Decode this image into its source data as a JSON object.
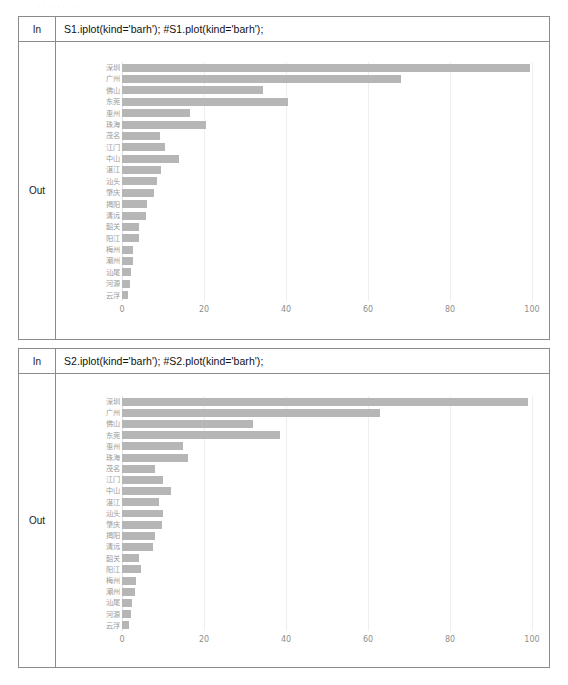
{
  "document": {
    "header_text": "· · · · · · · · · ·"
  },
  "cells": [
    {
      "in_label": "In",
      "out_label": "Out",
      "code": "S1.iplot(kind='barh'); #S1.plot(kind='barh');"
    },
    {
      "in_label": "In",
      "out_label": "Out",
      "code": "S2.iplot(kind='barh'); #S2.plot(kind='barh');"
    }
  ],
  "theme": {
    "bar_color": "#b6b6b6",
    "grid_color": "#ededf2",
    "tick_color": "#8e8e8e",
    "label_color": "#9a9a9a",
    "border_color": "#8a8a8a"
  },
  "chart_data": [
    {
      "type": "bar",
      "orientation": "horizontal",
      "title": "",
      "xlabel": "",
      "ylabel": "",
      "xlim": [
        0,
        100
      ],
      "xticks": [
        0,
        20,
        40,
        60,
        80,
        100
      ],
      "grid": true,
      "legend": false,
      "categories": [
        "云浮",
        "河源",
        "汕尾",
        "潮州",
        "梅州",
        "阳江",
        "韶关",
        "清远",
        "揭阳",
        "肇庆",
        "汕头",
        "湛江",
        "中山",
        "江门",
        "茂名",
        "珠海",
        "惠州",
        "东莞",
        "佛山",
        "广州",
        "深圳"
      ],
      "values": [
        1.5,
        2.0,
        2.2,
        2.8,
        2.8,
        4.2,
        4.2,
        5.8,
        6.2,
        7.8,
        8.6,
        9.5,
        14.0,
        10.5,
        9.2,
        20.5,
        16.5,
        40.5,
        34.5,
        68.0,
        99.5
      ]
    },
    {
      "type": "bar",
      "orientation": "horizontal",
      "title": "",
      "xlabel": "",
      "ylabel": "",
      "xlim": [
        0,
        100
      ],
      "xticks": [
        0,
        20,
        40,
        60,
        80,
        100
      ],
      "grid": true,
      "legend": false,
      "categories": [
        "云浮",
        "河源",
        "汕尾",
        "潮州",
        "梅州",
        "阳江",
        "韶关",
        "清远",
        "揭阳",
        "肇庆",
        "汕头",
        "湛江",
        "中山",
        "江门",
        "茂名",
        "珠海",
        "惠州",
        "东莞",
        "佛山",
        "广州",
        "深圳"
      ],
      "values": [
        1.8,
        2.2,
        2.4,
        3.2,
        3.4,
        4.6,
        4.2,
        7.5,
        8.0,
        9.8,
        10.0,
        9.0,
        12.0,
        10.0,
        8.0,
        16.0,
        14.8,
        38.5,
        32.0,
        63.0,
        99.0
      ]
    }
  ]
}
